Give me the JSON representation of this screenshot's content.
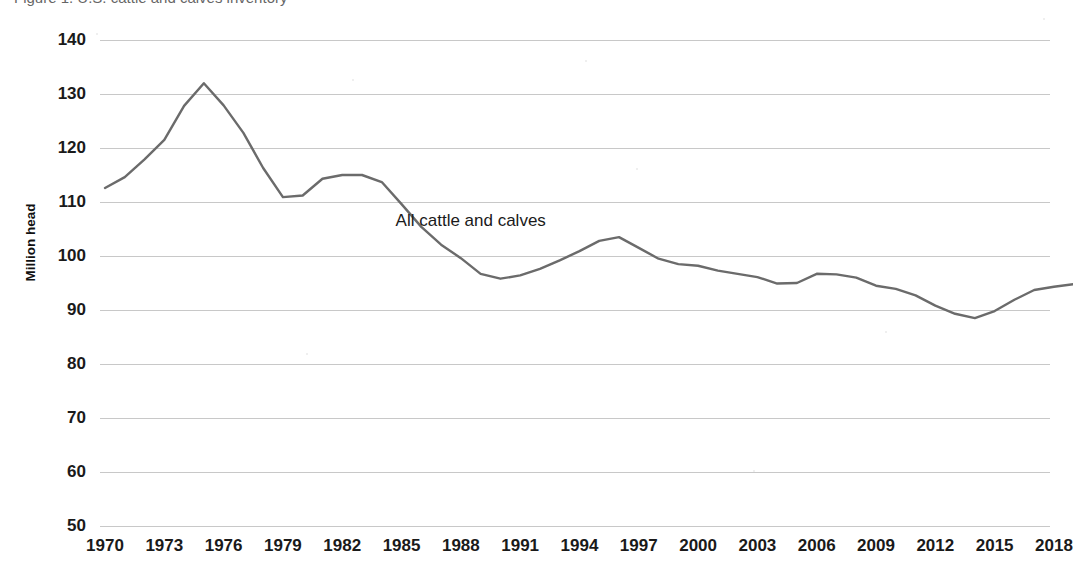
{
  "page": {
    "background_color": "#ffffff",
    "cut_off_header_text": "Figure 1. U.S. cattle and calves inventory"
  },
  "chart_data": {
    "type": "line",
    "title": "",
    "xlabel": "",
    "ylabel": "Million head",
    "ylim": [
      50,
      140
    ],
    "ytick_step": 10,
    "xlim": [
      1970,
      2019
    ],
    "grid": true,
    "legend_position": "inline-annotation",
    "line_color": "#6b6b6b",
    "grid_color": "#c8c8c8",
    "ytick_labels": [
      "140",
      "130",
      "120",
      "110",
      "100",
      "90",
      "80",
      "70",
      "60",
      "50"
    ],
    "xtick_labels": [
      "1970",
      "1973",
      "1976",
      "1979",
      "1982",
      "1985",
      "1988",
      "1991",
      "1994",
      "1997",
      "2000",
      "2003",
      "2006",
      "2009",
      "2012",
      "2015",
      "2018"
    ],
    "annotations": [
      {
        "text": "All cattle and calves",
        "x": 1988.5,
        "y": 106.5
      }
    ],
    "series": [
      {
        "name": "All cattle and calves",
        "x": [
          1970,
          1971,
          1972,
          1973,
          1974,
          1975,
          1976,
          1977,
          1978,
          1979,
          1980,
          1981,
          1982,
          1983,
          1984,
          1985,
          1986,
          1987,
          1988,
          1989,
          1990,
          1991,
          1992,
          1993,
          1994,
          1995,
          1996,
          1997,
          1998,
          1999,
          2000,
          2001,
          2002,
          2003,
          2004,
          2005,
          2006,
          2007,
          2008,
          2009,
          2010,
          2011,
          2012,
          2013,
          2014,
          2015,
          2016,
          2017,
          2018,
          2019
        ],
        "values": [
          112.6,
          114.6,
          117.9,
          121.5,
          127.8,
          132.0,
          127.9,
          122.8,
          116.3,
          110.9,
          111.2,
          114.3,
          115.0,
          115.0,
          113.7,
          109.6,
          105.4,
          102.1,
          99.6,
          96.7,
          95.8,
          96.4,
          97.6,
          99.2,
          100.9,
          102.8,
          103.5,
          101.5,
          99.5,
          98.5,
          98.2,
          97.3,
          96.7,
          96.1,
          94.9,
          95.0,
          96.7,
          96.6,
          96.0,
          94.5,
          93.9,
          92.7,
          90.8,
          89.3,
          88.5,
          89.8,
          91.9,
          93.7,
          94.3,
          94.8
        ]
      }
    ]
  },
  "axes_geometry": {
    "plot_left": 100,
    "plot_right": 1050,
    "y_top_px": 40,
    "y_bottom_px": 526,
    "x_first_tick_px": 105,
    "px_per_year": 19.77
  }
}
